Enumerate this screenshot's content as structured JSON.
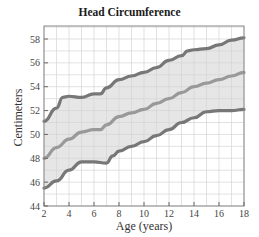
{
  "chart_data": {
    "type": "line",
    "title": "Head Circumference",
    "xlabel": "Age (years)",
    "ylabel": "Centimeters",
    "xlim": [
      2,
      18
    ],
    "ylim": [
      44,
      59
    ],
    "xticks": [
      2,
      4,
      6,
      8,
      10,
      12,
      14,
      16,
      18
    ],
    "yticks": [
      44,
      46,
      48,
      50,
      52,
      54,
      56,
      58
    ],
    "grid": true,
    "legend": null,
    "shaded_band": "between upper and lower curves",
    "series": [
      {
        "name": "upper",
        "color": "#777777",
        "x": [
          2,
          3,
          3.5,
          4,
          5,
          6,
          6.5,
          7,
          8,
          9,
          10,
          11,
          12,
          13,
          13.5,
          14,
          15,
          16,
          17,
          18
        ],
        "values": [
          51.1,
          52.2,
          53.1,
          53.2,
          53.1,
          53.4,
          53.4,
          53.9,
          54.6,
          54.9,
          55.2,
          55.6,
          56.2,
          56.6,
          57.0,
          57.1,
          57.2,
          57.5,
          57.9,
          58.1
        ]
      },
      {
        "name": "middle",
        "color": "#999999",
        "x": [
          2,
          3,
          4,
          5,
          6,
          6.5,
          7,
          8,
          9,
          10,
          11,
          12,
          13,
          14,
          15,
          16,
          17,
          18
        ],
        "values": [
          48.0,
          48.9,
          49.6,
          50.2,
          50.4,
          50.4,
          50.8,
          51.5,
          51.8,
          52.1,
          52.6,
          53.0,
          53.5,
          54.0,
          54.3,
          54.6,
          54.9,
          55.2
        ]
      },
      {
        "name": "lower",
        "color": "#777777",
        "x": [
          2,
          3,
          4,
          5,
          6,
          7,
          7.5,
          8,
          9,
          10,
          11,
          12,
          13,
          14,
          15,
          16,
          17,
          18
        ],
        "values": [
          45.5,
          46.1,
          47.0,
          47.7,
          47.7,
          47.6,
          48.2,
          48.6,
          49.0,
          49.4,
          49.9,
          50.4,
          51.0,
          51.4,
          51.9,
          52.0,
          52.0,
          52.1
        ]
      }
    ]
  },
  "colors": {
    "band_fill": "#e6e6e6",
    "grid": "#d4d4d4",
    "axis": "#888888"
  }
}
